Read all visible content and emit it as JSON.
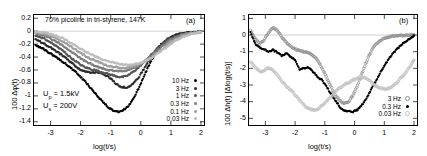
{
  "figure": {
    "panel_a": {
      "id_label": "(a)",
      "title": "70% picoline in tri-styrene, 147K",
      "ylabel": "100 Δφ(t)",
      "xlabel": "log(t/s)",
      "yticks": [
        "0.2",
        "0",
        "-0.2",
        "-0.4",
        "-0.6",
        "-0.8",
        "-1",
        "-1.2",
        "-1.4"
      ],
      "xticks": [
        "-3",
        "-2",
        "-1",
        "0",
        "1",
        "2"
      ],
      "annotations": [
        {
          "prefix": "U",
          "sub": "p",
          "suffix": " = 1.5kV"
        },
        {
          "prefix": "U",
          "sub": "s",
          "suffix": " = 200V"
        }
      ],
      "legend": [
        {
          "label": "10 Hz",
          "color": "#000000",
          "fill": "solid"
        },
        {
          "label": "3 Hz",
          "color": "#2b2b2b",
          "fill": "solid"
        },
        {
          "label": "1 Hz",
          "color": "#545454",
          "fill": "solid"
        },
        {
          "label": "0.3 Hz",
          "color": "#7d7d7d",
          "fill": "solid"
        },
        {
          "label": "0.1 Hz",
          "color": "#9e9e9e",
          "fill": "solid"
        },
        {
          "label": "0.03 Hz",
          "color": "#bcbcbc",
          "fill": "solid"
        }
      ]
    },
    "panel_b": {
      "id_label": "(b)",
      "ylabel": "100 Δh(t)  [Δlog(t/s)]",
      "xlabel": "log(t/s)",
      "yticks": [
        "1",
        "0",
        "-1",
        "-2",
        "-3",
        "-4",
        "-5"
      ],
      "xticks": [
        "-3",
        "-2",
        "-1",
        "0",
        "1",
        "2"
      ],
      "legend": [
        {
          "label": "3 Hz",
          "color": "#8f8f8f",
          "fill": "open"
        },
        {
          "label": "0.3 Hz",
          "color": "#000000",
          "fill": "solid"
        },
        {
          "label": "0.03 Hz",
          "color": "#c0c0c0",
          "fill": "open"
        }
      ]
    }
  },
  "chart_data": [
    {
      "type": "scatter",
      "panel": "(a)",
      "title": "70% picoline in tri-styrene, 147K",
      "xlabel": "log(t/s)",
      "ylabel": "100 Δφ(t)",
      "xlim": [
        -3.55,
        2.1
      ],
      "ylim": [
        -1.45,
        0.25
      ],
      "xticks": [
        -3,
        -2,
        -1,
        0,
        1,
        2
      ],
      "yticks": [
        0.2,
        0,
        -0.2,
        -0.4,
        -0.6,
        -0.8,
        -1,
        -1.2,
        -1.4
      ],
      "grid": false,
      "zero_line": 0,
      "legend_position": "bottom-right",
      "annotations": [
        "Up = 1.5kV",
        "Us = 200V",
        "(a)"
      ],
      "series": [
        {
          "name": "10 Hz",
          "color": "#000000",
          "x": [
            -3.5,
            -3.35,
            -3.2,
            -3.05,
            -2.9,
            -2.75,
            -2.6,
            -2.45,
            -2.3,
            -2.15,
            -2.0,
            -1.85,
            -1.7,
            -1.55,
            -1.4,
            -1.25,
            -1.1,
            -0.95,
            -0.8,
            -0.65,
            -0.5,
            -0.35,
            -0.2,
            -0.05,
            0.1,
            0.25,
            0.4,
            0.55,
            0.7,
            0.85,
            1.0,
            1.15,
            1.3,
            1.45,
            1.6,
            1.75,
            1.9,
            2.0
          ],
          "y": [
            -0.21,
            -0.25,
            -0.29,
            -0.33,
            -0.38,
            -0.42,
            -0.47,
            -0.52,
            -0.58,
            -0.64,
            -0.71,
            -0.78,
            -0.86,
            -0.94,
            -1.02,
            -1.1,
            -1.17,
            -1.22,
            -1.25,
            -1.24,
            -1.2,
            -1.12,
            -1.0,
            -0.86,
            -0.7,
            -0.55,
            -0.41,
            -0.3,
            -0.21,
            -0.15,
            -0.1,
            -0.07,
            -0.05,
            -0.035,
            -0.025,
            -0.02,
            -0.015,
            -0.01
          ]
        },
        {
          "name": "3 Hz",
          "color": "#2b2b2b",
          "x": [
            -3.5,
            -3.35,
            -3.2,
            -3.05,
            -2.9,
            -2.75,
            -2.6,
            -2.45,
            -2.3,
            -2.15,
            -2.0,
            -1.85,
            -1.7,
            -1.55,
            -1.4,
            -1.25,
            -1.1,
            -0.95,
            -0.8,
            -0.65,
            -0.5,
            -0.35,
            -0.2,
            -0.05,
            0.1,
            0.25,
            0.4,
            0.55,
            0.7,
            0.85,
            1.0,
            1.15,
            1.3,
            1.45,
            1.6,
            1.75,
            1.9,
            2.0
          ],
          "y": [
            -0.13,
            -0.16,
            -0.2,
            -0.24,
            -0.28,
            -0.33,
            -0.38,
            -0.43,
            -0.49,
            -0.55,
            -0.6,
            -0.63,
            -0.64,
            -0.64,
            -0.64,
            -0.66,
            -0.7,
            -0.76,
            -0.82,
            -0.86,
            -0.87,
            -0.85,
            -0.79,
            -0.7,
            -0.59,
            -0.47,
            -0.36,
            -0.27,
            -0.19,
            -0.13,
            -0.09,
            -0.06,
            -0.045,
            -0.03,
            -0.022,
            -0.018,
            -0.013,
            -0.01
          ]
        },
        {
          "name": "1 Hz",
          "color": "#545454",
          "x": [
            -3.5,
            -3.35,
            -3.2,
            -3.05,
            -2.9,
            -2.75,
            -2.6,
            -2.45,
            -2.3,
            -2.15,
            -2.0,
            -1.85,
            -1.7,
            -1.55,
            -1.4,
            -1.25,
            -1.1,
            -0.95,
            -0.8,
            -0.65,
            -0.5,
            -0.35,
            -0.2,
            -0.05,
            0.1,
            0.25,
            0.4,
            0.55,
            0.7,
            0.85,
            1.0,
            1.15,
            1.3,
            1.45,
            1.6,
            1.75,
            1.9,
            2.0
          ],
          "y": [
            -0.07,
            -0.09,
            -0.12,
            -0.16,
            -0.2,
            -0.25,
            -0.3,
            -0.36,
            -0.42,
            -0.47,
            -0.52,
            -0.56,
            -0.58,
            -0.6,
            -0.62,
            -0.64,
            -0.66,
            -0.68,
            -0.7,
            -0.71,
            -0.7,
            -0.66,
            -0.61,
            -0.55,
            -0.48,
            -0.41,
            -0.34,
            -0.27,
            -0.2,
            -0.15,
            -0.11,
            -0.08,
            -0.06,
            -0.04,
            -0.03,
            -0.02,
            -0.015,
            -0.01
          ]
        },
        {
          "name": "0.3 Hz",
          "color": "#7d7d7d",
          "x": [
            -3.5,
            -3.35,
            -3.2,
            -3.05,
            -2.9,
            -2.75,
            -2.6,
            -2.45,
            -2.3,
            -2.15,
            -2.0,
            -1.85,
            -1.7,
            -1.55,
            -1.4,
            -1.25,
            -1.1,
            -0.95,
            -0.8,
            -0.65,
            -0.5,
            -0.35,
            -0.2,
            -0.05,
            0.1,
            0.25,
            0.4,
            0.55,
            0.7,
            0.85,
            1.0,
            1.15,
            1.3,
            1.45,
            1.6,
            1.75,
            1.9,
            2.0
          ],
          "y": [
            -0.04,
            -0.05,
            -0.07,
            -0.1,
            -0.14,
            -0.18,
            -0.22,
            -0.27,
            -0.32,
            -0.37,
            -0.42,
            -0.46,
            -0.5,
            -0.53,
            -0.56,
            -0.58,
            -0.6,
            -0.61,
            -0.62,
            -0.62,
            -0.61,
            -0.59,
            -0.56,
            -0.52,
            -0.47,
            -0.42,
            -0.36,
            -0.3,
            -0.24,
            -0.18,
            -0.13,
            -0.1,
            -0.07,
            -0.05,
            -0.035,
            -0.025,
            -0.018,
            -0.012
          ]
        },
        {
          "name": "0.1 Hz",
          "color": "#9e9e9e",
          "x": [
            -3.5,
            -3.35,
            -3.2,
            -3.05,
            -2.9,
            -2.75,
            -2.6,
            -2.45,
            -2.3,
            -2.15,
            -2.0,
            -1.85,
            -1.7,
            -1.55,
            -1.4,
            -1.25,
            -1.1,
            -0.95,
            -0.8,
            -0.65,
            -0.5,
            -0.35,
            -0.2,
            -0.05,
            0.1,
            0.25,
            0.4,
            0.55,
            0.7,
            0.85,
            1.0,
            1.15,
            1.3,
            1.45,
            1.6,
            1.75,
            1.9,
            2.0
          ],
          "y": [
            -0.02,
            -0.03,
            -0.04,
            -0.06,
            -0.09,
            -0.12,
            -0.16,
            -0.2,
            -0.25,
            -0.29,
            -0.34,
            -0.38,
            -0.42,
            -0.45,
            -0.48,
            -0.51,
            -0.53,
            -0.55,
            -0.56,
            -0.57,
            -0.57,
            -0.56,
            -0.54,
            -0.51,
            -0.48,
            -0.44,
            -0.39,
            -0.34,
            -0.28,
            -0.22,
            -0.17,
            -0.13,
            -0.09,
            -0.065,
            -0.045,
            -0.03,
            -0.02,
            -0.014
          ]
        },
        {
          "name": "0.03 Hz",
          "color": "#bcbcbc",
          "x": [
            -3.5,
            -3.35,
            -3.2,
            -3.05,
            -2.9,
            -2.75,
            -2.6,
            -2.45,
            -2.3,
            -2.15,
            -2.0,
            -1.85,
            -1.7,
            -1.55,
            -1.4,
            -1.25,
            -1.1,
            -0.95,
            -0.8,
            -0.65,
            -0.5,
            -0.35,
            -0.2,
            -0.05,
            0.1,
            0.25,
            0.4,
            0.55,
            0.7,
            0.85,
            1.0,
            1.15,
            1.3,
            1.45,
            1.6,
            1.75,
            1.9,
            2.0
          ],
          "y": [
            -0.01,
            -0.015,
            -0.025,
            -0.04,
            -0.06,
            -0.08,
            -0.11,
            -0.15,
            -0.19,
            -0.23,
            -0.27,
            -0.31,
            -0.35,
            -0.38,
            -0.41,
            -0.44,
            -0.46,
            -0.48,
            -0.5,
            -0.51,
            -0.52,
            -0.52,
            -0.51,
            -0.5,
            -0.47,
            -0.44,
            -0.4,
            -0.35,
            -0.3,
            -0.25,
            -0.2,
            -0.15,
            -0.11,
            -0.08,
            -0.055,
            -0.038,
            -0.025,
            -0.017
          ]
        }
      ]
    },
    {
      "type": "scatter",
      "panel": "(b)",
      "xlabel": "log(t/s)",
      "ylabel": "100 Δh(t)  [Δlog(t/s)]",
      "xlim": [
        -3.55,
        2.1
      ],
      "ylim": [
        -5.4,
        1.2
      ],
      "xticks": [
        -3,
        -2,
        -1,
        0,
        1,
        2
      ],
      "yticks": [
        1,
        0,
        -1,
        -2,
        -3,
        -4,
        -5
      ],
      "grid": false,
      "zero_line": 0,
      "legend_position": "bottom-right",
      "annotations": [
        "(b)"
      ],
      "series": [
        {
          "name": "3 Hz",
          "color": "#8f8f8f",
          "fill": "open",
          "x": [
            -3.5,
            -3.35,
            -3.2,
            -3.05,
            -2.9,
            -2.75,
            -2.6,
            -2.45,
            -2.3,
            -2.15,
            -2.0,
            -1.85,
            -1.7,
            -1.55,
            -1.4,
            -1.25,
            -1.1,
            -0.95,
            -0.8,
            -0.65,
            -0.5,
            -0.35,
            -0.2,
            -0.05,
            0.1,
            0.25,
            0.4,
            0.55,
            0.7,
            0.85,
            1.0,
            1.15,
            1.3,
            1.45,
            1.6,
            1.75,
            1.9,
            2.0
          ],
          "y": [
            0.3,
            -0.2,
            -0.55,
            -0.3,
            0.1,
            0.45,
            0.3,
            -0.1,
            -0.45,
            -0.7,
            -0.85,
            -0.95,
            -1.0,
            -1.05,
            -1.2,
            -1.5,
            -1.95,
            -2.5,
            -3.1,
            -3.6,
            -3.95,
            -4.1,
            -4.0,
            -3.6,
            -3.0,
            -2.3,
            -1.6,
            -1.0,
            -0.6,
            -0.35,
            -0.2,
            -0.12,
            -0.08,
            -0.05,
            -0.03,
            -0.02,
            -0.01,
            0.0
          ]
        },
        {
          "name": "0.3 Hz",
          "color": "#000000",
          "fill": "solid",
          "x": [
            -3.5,
            -3.35,
            -3.2,
            -3.05,
            -2.9,
            -2.75,
            -2.6,
            -2.45,
            -2.3,
            -2.15,
            -2.0,
            -1.85,
            -1.7,
            -1.55,
            -1.4,
            -1.25,
            -1.1,
            -0.95,
            -0.8,
            -0.65,
            -0.5,
            -0.35,
            -0.2,
            -0.05,
            0.1,
            0.25,
            0.4,
            0.55,
            0.7,
            0.85,
            1.0,
            1.15,
            1.3,
            1.45,
            1.6,
            1.75,
            1.9,
            2.0
          ],
          "y": [
            0.15,
            -0.5,
            -0.75,
            -0.85,
            -1.0,
            -0.9,
            -1.05,
            -1.25,
            -1.1,
            -1.3,
            -1.5,
            -2.1,
            -2.0,
            -1.95,
            -2.2,
            -2.5,
            -2.7,
            -3.1,
            -3.5,
            -3.9,
            -4.3,
            -4.55,
            -4.6,
            -4.6,
            -4.5,
            -4.2,
            -3.8,
            -3.3,
            -2.8,
            -2.3,
            -1.85,
            -1.45,
            -1.1,
            -0.8,
            -0.55,
            -0.35,
            -0.15,
            -0.02
          ]
        },
        {
          "name": "0.03 Hz",
          "color": "#c0c0c0",
          "fill": "open",
          "x": [
            -3.5,
            -3.35,
            -3.2,
            -3.05,
            -2.9,
            -2.75,
            -2.6,
            -2.45,
            -2.3,
            -2.15,
            -2.0,
            -1.85,
            -1.7,
            -1.55,
            -1.4,
            -1.25,
            -1.1,
            -0.95,
            -0.8,
            -0.65,
            -0.5,
            -0.35,
            -0.2,
            -0.05,
            0.1,
            0.25,
            0.4,
            0.55,
            0.7,
            0.85,
            1.0,
            1.15,
            1.3,
            1.45,
            1.6,
            1.75,
            1.9,
            2.0
          ],
          "y": [
            -1.6,
            -1.9,
            -2.2,
            -2.15,
            -1.95,
            -2.1,
            -2.4,
            -2.75,
            -3.05,
            -3.3,
            -3.6,
            -3.9,
            -4.2,
            -4.4,
            -4.5,
            -4.45,
            -4.25,
            -4.0,
            -3.7,
            -3.4,
            -3.2,
            -3.0,
            -2.85,
            -2.7,
            -2.6,
            -2.55,
            -2.6,
            -2.8,
            -3.05,
            -3.2,
            -3.25,
            -3.2,
            -3.05,
            -2.8,
            -2.5,
            -2.15,
            -1.8,
            -1.5
          ]
        }
      ]
    }
  ]
}
